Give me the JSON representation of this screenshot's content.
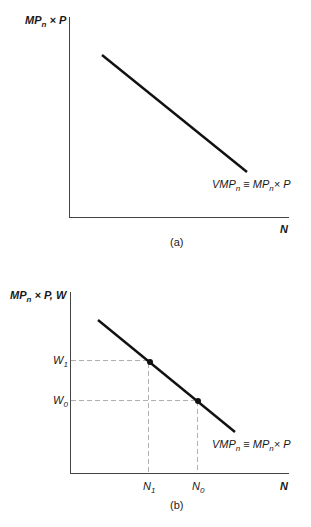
{
  "panel_a": {
    "caption": "(a)",
    "y_axis_label": {
      "main": "MP",
      "sub": "n",
      "rest": " × P"
    },
    "x_axis_label": "N",
    "curve_label": {
      "a": "VMP",
      "a_sub": "n",
      "mid": " ≡ MP",
      "b_sub": "n",
      "rest": "× P"
    }
  },
  "panel_b": {
    "caption": "(b)",
    "y_axis_label": {
      "main": "MP",
      "sub": "n",
      "rest": " × P, W"
    },
    "x_axis_label": "N",
    "curve_label": {
      "a": "VMP",
      "a_sub": "n",
      "mid": " ≡ MP",
      "b_sub": "n",
      "rest": "× P"
    },
    "y_ticks": [
      {
        "main": "W",
        "sub": "1"
      },
      {
        "main": "W",
        "sub": "0"
      }
    ],
    "x_ticks": [
      {
        "main": "N",
        "sub": "1"
      },
      {
        "main": "N",
        "sub": "0"
      }
    ]
  },
  "colors": {
    "line": "#111111",
    "axis": "#444444",
    "dash": "#b0b0b0"
  }
}
